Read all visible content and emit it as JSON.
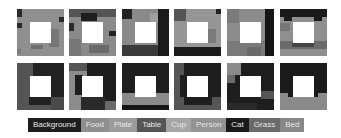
{
  "figure": {
    "rows": 2,
    "columns": 6
  },
  "colors": {
    "Background": "#222222",
    "Food": "#8c8c8c",
    "Plate": "#9a9a9a",
    "Table": "#5a5a5a",
    "Cup": "#a8a8a8",
    "Person": "#969696",
    "Cat": "#1c1c1c",
    "Grass": "#6e6e6e",
    "Bed": "#8a8a8a"
  },
  "legend": {
    "items": [
      {
        "label": "Background",
        "color": "#1e1e1e"
      },
      {
        "label": "Food",
        "color": "#8e8e8e"
      },
      {
        "label": "Plate",
        "color": "#9b9b9b"
      },
      {
        "label": "Table",
        "color": "#555555"
      },
      {
        "label": "Cup",
        "color": "#a6a6a6"
      },
      {
        "label": "Person",
        "color": "#939393"
      },
      {
        "label": "Cat",
        "color": "#1a1a1a"
      },
      {
        "label": "Grass",
        "color": "#6a6a6a"
      },
      {
        "label": "Bed",
        "color": "#888888"
      }
    ]
  },
  "tiles": [
    {
      "row": 0,
      "col": 0,
      "base": "#8f8f8f",
      "blocks": [
        {
          "x": 0,
          "y": 0,
          "w": 5,
          "h": 8,
          "c": "#2a2a2a"
        },
        {
          "x": 0,
          "y": 14,
          "w": 5,
          "h": 5,
          "c": "#2a2a2a"
        },
        {
          "x": 42,
          "y": 8,
          "w": 5,
          "h": 5,
          "c": "#2a2a2a"
        },
        {
          "x": 32,
          "y": 20,
          "w": 10,
          "h": 18,
          "c": "#777777"
        },
        {
          "x": 14,
          "y": 36,
          "w": 12,
          "h": 4,
          "c": "#6f6f6f"
        },
        {
          "x": 0,
          "y": 40,
          "w": 4,
          "h": 5,
          "c": "#7a7a7a"
        }
      ]
    },
    {
      "row": 0,
      "col": 1,
      "base": "#8a8a8a",
      "blocks": [
        {
          "x": 0,
          "y": 0,
          "w": 47,
          "h": 8,
          "c": "#555555"
        },
        {
          "x": 12,
          "y": 4,
          "w": 16,
          "h": 8,
          "c": "#1e1e1e"
        },
        {
          "x": 0,
          "y": 14,
          "w": 5,
          "h": 8,
          "c": "#2a2a2a"
        },
        {
          "x": 40,
          "y": 22,
          "w": 7,
          "h": 5,
          "c": "#222222"
        },
        {
          "x": 0,
          "y": 30,
          "w": 12,
          "h": 17,
          "c": "#777777"
        },
        {
          "x": 20,
          "y": 36,
          "w": 20,
          "h": 8,
          "c": "#6a6a6a"
        }
      ]
    },
    {
      "row": 0,
      "col": 2,
      "base": "#8a8a8a",
      "blocks": [
        {
          "x": 0,
          "y": 0,
          "w": 10,
          "h": 10,
          "c": "#222222"
        },
        {
          "x": 36,
          "y": 0,
          "w": 11,
          "h": 47,
          "c": "#1a1a1a"
        },
        {
          "x": 0,
          "y": 36,
          "w": 36,
          "h": 11,
          "c": "#3a3a3a"
        },
        {
          "x": 28,
          "y": 4,
          "w": 8,
          "h": 10,
          "c": "#9e9e9e"
        }
      ]
    },
    {
      "row": 0,
      "col": 3,
      "base": "#959595",
      "blocks": [
        {
          "x": 0,
          "y": 0,
          "w": 12,
          "h": 12,
          "c": "#555555"
        },
        {
          "x": 42,
          "y": 0,
          "w": 5,
          "h": 5,
          "c": "#222222"
        },
        {
          "x": 0,
          "y": 38,
          "w": 47,
          "h": 9,
          "c": "#1a1a1a"
        },
        {
          "x": 34,
          "y": 20,
          "w": 8,
          "h": 14,
          "c": "#7a7a7a"
        }
      ]
    },
    {
      "row": 0,
      "col": 4,
      "base": "#8c8c8c",
      "blocks": [
        {
          "x": 0,
          "y": 0,
          "w": 12,
          "h": 14,
          "c": "#7a7a7a"
        },
        {
          "x": 38,
          "y": 0,
          "w": 9,
          "h": 47,
          "c": "#151515"
        },
        {
          "x": 0,
          "y": 32,
          "w": 38,
          "h": 15,
          "c": "#7a7a7a"
        },
        {
          "x": 20,
          "y": 38,
          "w": 14,
          "h": 9,
          "c": "#6a6a6a"
        }
      ]
    },
    {
      "row": 0,
      "col": 5,
      "base": "#8f8f8f",
      "blocks": [
        {
          "x": 0,
          "y": 0,
          "w": 47,
          "h": 8,
          "c": "#1a1a1a"
        },
        {
          "x": 4,
          "y": 8,
          "w": 8,
          "h": 4,
          "c": "#1a1a1a"
        },
        {
          "x": 34,
          "y": 8,
          "w": 8,
          "h": 4,
          "c": "#1a1a1a"
        },
        {
          "x": 0,
          "y": 14,
          "w": 10,
          "h": 8,
          "c": "#777777"
        },
        {
          "x": 0,
          "y": 32,
          "w": 47,
          "h": 8,
          "c": "#6a6a6a"
        },
        {
          "x": 12,
          "y": 34,
          "w": 22,
          "h": 4,
          "c": "#444444"
        }
      ]
    },
    {
      "row": 1,
      "col": 0,
      "base": "#555555",
      "blocks": [
        {
          "x": 16,
          "y": 0,
          "w": 31,
          "h": 14,
          "c": "#222222"
        },
        {
          "x": 34,
          "y": 14,
          "w": 13,
          "h": 20,
          "c": "#222222"
        },
        {
          "x": 12,
          "y": 34,
          "w": 22,
          "h": 8,
          "c": "#222222"
        },
        {
          "x": 34,
          "y": 34,
          "w": 13,
          "h": 13,
          "c": "#4a4a4a"
        }
      ]
    },
    {
      "row": 1,
      "col": 1,
      "base": "#8c8c8c",
      "blocks": [
        {
          "x": 0,
          "y": 0,
          "w": 18,
          "h": 8,
          "c": "#555555"
        },
        {
          "x": 18,
          "y": 0,
          "w": 29,
          "h": 47,
          "c": "#1e1e1e"
        },
        {
          "x": 6,
          "y": 12,
          "w": 8,
          "h": 20,
          "c": "#1e1e1e"
        },
        {
          "x": 12,
          "y": 34,
          "w": 24,
          "h": 13,
          "c": "#2a2a2a"
        },
        {
          "x": 36,
          "y": 38,
          "w": 11,
          "h": 9,
          "c": "#6a6a6a"
        }
      ]
    },
    {
      "row": 1,
      "col": 2,
      "base": "#1e1e1e",
      "blocks": [
        {
          "x": 0,
          "y": 30,
          "w": 47,
          "h": 12,
          "c": "#8a8a8a"
        },
        {
          "x": 0,
          "y": 42,
          "w": 47,
          "h": 5,
          "c": "#151515"
        }
      ]
    },
    {
      "row": 1,
      "col": 3,
      "base": "#555555",
      "blocks": [
        {
          "x": 10,
          "y": 0,
          "w": 37,
          "h": 14,
          "c": "#1e1e1e"
        },
        {
          "x": 6,
          "y": 12,
          "w": 8,
          "h": 22,
          "c": "#1e1e1e"
        },
        {
          "x": 34,
          "y": 10,
          "w": 13,
          "h": 24,
          "c": "#1e1e1e"
        },
        {
          "x": 10,
          "y": 34,
          "w": 28,
          "h": 8,
          "c": "#1e1e1e"
        }
      ]
    },
    {
      "row": 1,
      "col": 4,
      "base": "#1e1e1e",
      "blocks": [
        {
          "x": 0,
          "y": 0,
          "w": 14,
          "h": 12,
          "c": "#8a8a8a"
        },
        {
          "x": 0,
          "y": 12,
          "w": 8,
          "h": 8,
          "c": "#6a6a6a"
        },
        {
          "x": 34,
          "y": 28,
          "w": 13,
          "h": 8,
          "c": "#555555"
        },
        {
          "x": 0,
          "y": 40,
          "w": 30,
          "h": 7,
          "c": "#2a2a2a"
        }
      ]
    },
    {
      "row": 1,
      "col": 5,
      "base": "#1a1a1a",
      "blocks": [
        {
          "x": 0,
          "y": 34,
          "w": 47,
          "h": 13,
          "c": "#8a8a8a"
        },
        {
          "x": 0,
          "y": 30,
          "w": 8,
          "h": 4,
          "c": "#8a8a8a"
        },
        {
          "x": 38,
          "y": 30,
          "w": 9,
          "h": 4,
          "c": "#8a8a8a"
        }
      ]
    }
  ],
  "layout": {
    "col_x": [
      0,
      52,
      105,
      157,
      210,
      263
    ],
    "row_y": [
      0,
      54
    ]
  }
}
